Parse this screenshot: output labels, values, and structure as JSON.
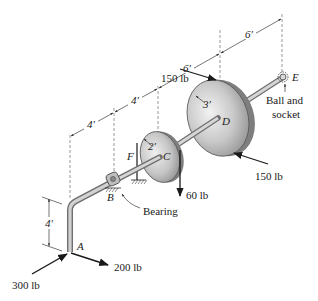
{
  "diagram": {
    "type": "statics-shaft-pulley",
    "points": {
      "A": "A",
      "B": "B",
      "C": "C",
      "D": "D",
      "E": "E",
      "F": "F"
    },
    "dimensions": {
      "vertical_arm": "4′",
      "seg_A_B": "4′",
      "seg_B_C": "4′",
      "seg_C_D": "6′",
      "seg_D_E": "6′",
      "radius_C": "2′",
      "radius_D": "3′"
    },
    "forces": {
      "force_at_A_1": "300 lb",
      "force_at_A_2": "200 lb",
      "force_D_top": "150 lb",
      "force_D_bottom": "150 lb",
      "force_C": "60 lb"
    },
    "supports": {
      "bearing": "Bearing",
      "ball_socket_line1": "Ball and",
      "ball_socket_line2": "socket"
    }
  }
}
